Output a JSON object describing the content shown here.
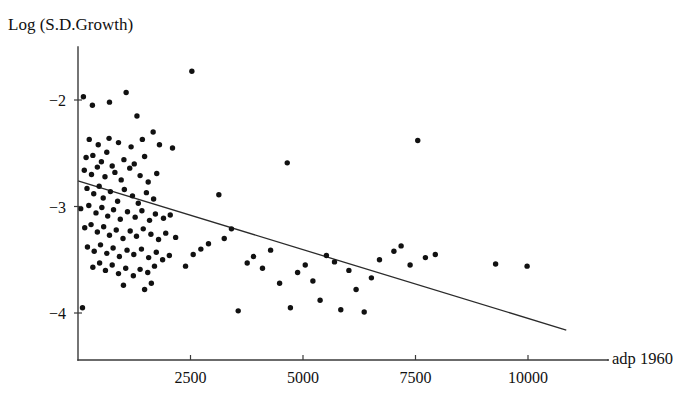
{
  "chart_data": {
    "type": "scatter",
    "title": "",
    "ylabel": "Log (S.D.Growth)",
    "xlabel": "adp 1960",
    "xlim": [
      0,
      11600
    ],
    "ylim": [
      -4.35,
      -1.58
    ],
    "grid": false,
    "legend": "none",
    "xticks": [
      2500,
      5000,
      7500,
      10000
    ],
    "xtick_labels": [
      "2500",
      "5000",
      "7500",
      "10000"
    ],
    "yticks": [
      -2,
      -3,
      -4
    ],
    "ytick_labels": [
      "−2",
      "−3",
      "−4"
    ],
    "point_color": "#111111",
    "line_color": "#2b2b2b",
    "axis_color": "#3a3a3a",
    "background": "#ffffff",
    "fit_line": {
      "label": "regression line",
      "x": [
        0,
        10850
      ],
      "y": [
        -2.76,
        -4.16
      ]
    },
    "points": [
      [
        120,
        -1.97
      ],
      [
        320,
        -2.05
      ],
      [
        700,
        -2.02
      ],
      [
        1070,
        -1.93
      ],
      [
        2530,
        -1.73
      ],
      [
        1310,
        -2.15
      ],
      [
        1670,
        -2.3
      ],
      [
        250,
        -2.37
      ],
      [
        450,
        -2.42
      ],
      [
        690,
        -2.36
      ],
      [
        900,
        -2.4
      ],
      [
        1180,
        -2.44
      ],
      [
        1430,
        -2.37
      ],
      [
        1810,
        -2.42
      ],
      [
        2100,
        -2.45
      ],
      [
        180,
        -2.54
      ],
      [
        330,
        -2.52
      ],
      [
        520,
        -2.58
      ],
      [
        640,
        -2.49
      ],
      [
        760,
        -2.62
      ],
      [
        1020,
        -2.56
      ],
      [
        1250,
        -2.6
      ],
      [
        1480,
        -2.53
      ],
      [
        140,
        -2.66
      ],
      [
        300,
        -2.7
      ],
      [
        430,
        -2.63
      ],
      [
        600,
        -2.72
      ],
      [
        820,
        -2.68
      ],
      [
        960,
        -2.75
      ],
      [
        1150,
        -2.64
      ],
      [
        1380,
        -2.71
      ],
      [
        1560,
        -2.77
      ],
      [
        1750,
        -2.69
      ],
      [
        200,
        -2.83
      ],
      [
        350,
        -2.88
      ],
      [
        470,
        -2.81
      ],
      [
        560,
        -2.92
      ],
      [
        720,
        -2.86
      ],
      [
        880,
        -2.95
      ],
      [
        1030,
        -2.84
      ],
      [
        1210,
        -2.9
      ],
      [
        1340,
        -2.97
      ],
      [
        1520,
        -2.87
      ],
      [
        1680,
        -2.93
      ],
      [
        60,
        -3.02
      ],
      [
        240,
        -2.99
      ],
      [
        400,
        -3.06
      ],
      [
        530,
        -3.01
      ],
      [
        660,
        -3.09
      ],
      [
        790,
        -3.03
      ],
      [
        940,
        -3.12
      ],
      [
        1100,
        -3.05
      ],
      [
        1270,
        -3.1
      ],
      [
        1420,
        -3.04
      ],
      [
        1590,
        -3.13
      ],
      [
        1720,
        -3.07
      ],
      [
        1900,
        -3.11
      ],
      [
        2050,
        -3.08
      ],
      [
        150,
        -3.2
      ],
      [
        290,
        -3.17
      ],
      [
        430,
        -3.24
      ],
      [
        570,
        -3.19
      ],
      [
        700,
        -3.27
      ],
      [
        850,
        -3.22
      ],
      [
        1000,
        -3.3
      ],
      [
        1160,
        -3.23
      ],
      [
        1300,
        -3.28
      ],
      [
        1450,
        -3.21
      ],
      [
        1620,
        -3.26
      ],
      [
        1790,
        -3.31
      ],
      [
        1950,
        -3.25
      ],
      [
        2170,
        -3.29
      ],
      [
        210,
        -3.38
      ],
      [
        360,
        -3.42
      ],
      [
        500,
        -3.36
      ],
      [
        640,
        -3.44
      ],
      [
        780,
        -3.39
      ],
      [
        920,
        -3.47
      ],
      [
        1090,
        -3.41
      ],
      [
        1240,
        -3.45
      ],
      [
        1410,
        -3.4
      ],
      [
        1570,
        -3.48
      ],
      [
        1740,
        -3.43
      ],
      [
        1880,
        -3.5
      ],
      [
        2030,
        -3.46
      ],
      [
        330,
        -3.57
      ],
      [
        480,
        -3.53
      ],
      [
        610,
        -3.6
      ],
      [
        760,
        -3.55
      ],
      [
        900,
        -3.63
      ],
      [
        1060,
        -3.58
      ],
      [
        1230,
        -3.65
      ],
      [
        1380,
        -3.59
      ],
      [
        1550,
        -3.62
      ],
      [
        1700,
        -3.56
      ],
      [
        1010,
        -3.74
      ],
      [
        1480,
        -3.78
      ],
      [
        1630,
        -3.72
      ],
      [
        100,
        -3.95
      ],
      [
        2390,
        -3.56
      ],
      [
        2560,
        -3.45
      ],
      [
        2730,
        -3.4
      ],
      [
        2900,
        -3.35
      ],
      [
        3130,
        -2.89
      ],
      [
        3250,
        -3.3
      ],
      [
        3410,
        -3.21
      ],
      [
        3560,
        -3.98
      ],
      [
        3760,
        -3.53
      ],
      [
        3900,
        -3.47
      ],
      [
        4100,
        -3.58
      ],
      [
        4280,
        -3.41
      ],
      [
        4480,
        -3.72
      ],
      [
        4650,
        -2.59
      ],
      [
        4720,
        -3.95
      ],
      [
        4880,
        -3.62
      ],
      [
        5050,
        -3.55
      ],
      [
        5220,
        -3.7
      ],
      [
        5380,
        -3.88
      ],
      [
        5520,
        -3.46
      ],
      [
        5700,
        -3.52
      ],
      [
        5840,
        -3.97
      ],
      [
        6020,
        -3.6
      ],
      [
        6180,
        -3.78
      ],
      [
        6360,
        -3.99
      ],
      [
        6520,
        -3.67
      ],
      [
        6700,
        -3.5
      ],
      [
        7020,
        -3.42
      ],
      [
        7180,
        -3.37
      ],
      [
        7380,
        -3.55
      ],
      [
        7550,
        -2.38
      ],
      [
        7720,
        -3.48
      ],
      [
        7940,
        -3.45
      ],
      [
        9280,
        -3.54
      ],
      [
        9980,
        -3.56
      ]
    ]
  },
  "axis_titles": {
    "y": "Log (S.D.Growth)",
    "x": "adp 1960"
  }
}
